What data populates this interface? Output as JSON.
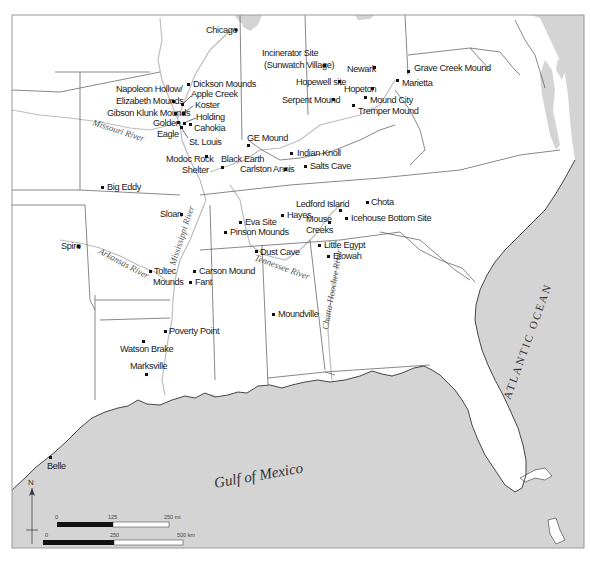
{
  "map": {
    "title": "Archaeological sites of the Eastern Woodlands",
    "colors": {
      "land": "#ffffff",
      "water": "#d4d4d4",
      "border": "#555555",
      "river": "#bdbdbd",
      "text": "#1a1a1a"
    },
    "water_bodies": {
      "gulf": "Gulf of Mexico",
      "atlantic": "ATLANTIC OCEAN"
    },
    "rivers": {
      "missouri": "Missouri River",
      "mississippi": "Mississippi River",
      "arkansas": "Arkansas River",
      "tennessee": "Tennessee River",
      "chatta": "Chatta-Hoochee River"
    },
    "cities": [
      {
        "name": "Chicago",
        "x": 233,
        "y": 30
      },
      {
        "name": "St. Louis",
        "x": 181,
        "y": 124
      }
    ],
    "sites": [
      {
        "name": "Incinerator Site",
        "x": 324,
        "y": 65
      },
      {
        "name": "(Sunwatch Village)",
        "x": 324,
        "y": 65
      },
      {
        "name": "Newark",
        "x": 374,
        "y": 68
      },
      {
        "name": "Grave Creek Mound",
        "x": 408,
        "y": 72
      },
      {
        "name": "Hopewell site",
        "x": 339,
        "y": 82
      },
      {
        "name": "Marietta",
        "x": 397,
        "y": 81
      },
      {
        "name": "Hopeton",
        "x": 372,
        "y": 89
      },
      {
        "name": "Serpent Mound",
        "x": 333,
        "y": 100
      },
      {
        "name": "Mound City",
        "x": 365,
        "y": 98
      },
      {
        "name": "Tremper Mound",
        "x": 353,
        "y": 106
      },
      {
        "name": "Dickson Mounds",
        "x": 188,
        "y": 85
      },
      {
        "name": "Napoleon Hollow/",
        "x": 0,
        "y": 0
      },
      {
        "name": "Elizabeth Mounds",
        "x": 173,
        "y": 101
      },
      {
        "name": "Apple Creek",
        "x": 182,
        "y": 104
      },
      {
        "name": "Koster",
        "x": 183,
        "y": 113
      },
      {
        "name": "Gibson Klunk Mounds",
        "x": 176,
        "y": 113
      },
      {
        "name": "Holding",
        "x": 184,
        "y": 123
      },
      {
        "name": "Golden Eagle",
        "x": 179,
        "y": 122
      },
      {
        "name": "Cahokia",
        "x": 190,
        "y": 124
      },
      {
        "name": "GE Mound",
        "x": 248,
        "y": 145
      },
      {
        "name": "Indian Knoll",
        "x": 292,
        "y": 153
      },
      {
        "name": "Modoc Rock Shelter",
        "x": 206,
        "y": 156
      },
      {
        "name": "Black Earth",
        "x": 223,
        "y": 167
      },
      {
        "name": "Carlston Annis",
        "x": 286,
        "y": 169
      },
      {
        "name": "Salts Cave",
        "x": 305,
        "y": 166
      },
      {
        "name": "Big Eddy",
        "x": 102,
        "y": 187
      },
      {
        "name": "Chota",
        "x": 367,
        "y": 202
      },
      {
        "name": "Ledford Island",
        "x": 339,
        "y": 210
      },
      {
        "name": "Sloan",
        "x": 181,
        "y": 214
      },
      {
        "name": "Hayes",
        "x": 282,
        "y": 215
      },
      {
        "name": "Eva Site",
        "x": 240,
        "y": 222
      },
      {
        "name": "Mouse Creeks",
        "x": 328,
        "y": 222
      },
      {
        "name": "Icehouse Bottom Site",
        "x": 346,
        "y": 218
      },
      {
        "name": "Pinson Mounds",
        "x": 225,
        "y": 232
      },
      {
        "name": "Spiro",
        "x": 79,
        "y": 246
      },
      {
        "name": "Little Egypt",
        "x": 319,
        "y": 245
      },
      {
        "name": "Dust Cave",
        "x": 256,
        "y": 251
      },
      {
        "name": "Etowah",
        "x": 328,
        "y": 256
      },
      {
        "name": "Toltec Mounds",
        "x": 150,
        "y": 271
      },
      {
        "name": "Carson Mound",
        "x": 194,
        "y": 271
      },
      {
        "name": "Fant",
        "x": 190,
        "y": 282
      },
      {
        "name": "Moundville",
        "x": 273,
        "y": 314
      },
      {
        "name": "Poverty Point",
        "x": 165,
        "y": 331
      },
      {
        "name": "Watson Brake",
        "x": 143,
        "y": 341
      },
      {
        "name": "Marksville",
        "x": 146,
        "y": 374
      },
      {
        "name": "Belle",
        "x": 50,
        "y": 457
      }
    ],
    "north_arrow": {
      "label": "N"
    },
    "scale_bars": [
      {
        "unit": "mi",
        "ticks": [
          "0",
          "125",
          "250 mi"
        ]
      },
      {
        "unit": "km",
        "ticks": [
          "0",
          "250",
          "500 km"
        ]
      }
    ]
  }
}
